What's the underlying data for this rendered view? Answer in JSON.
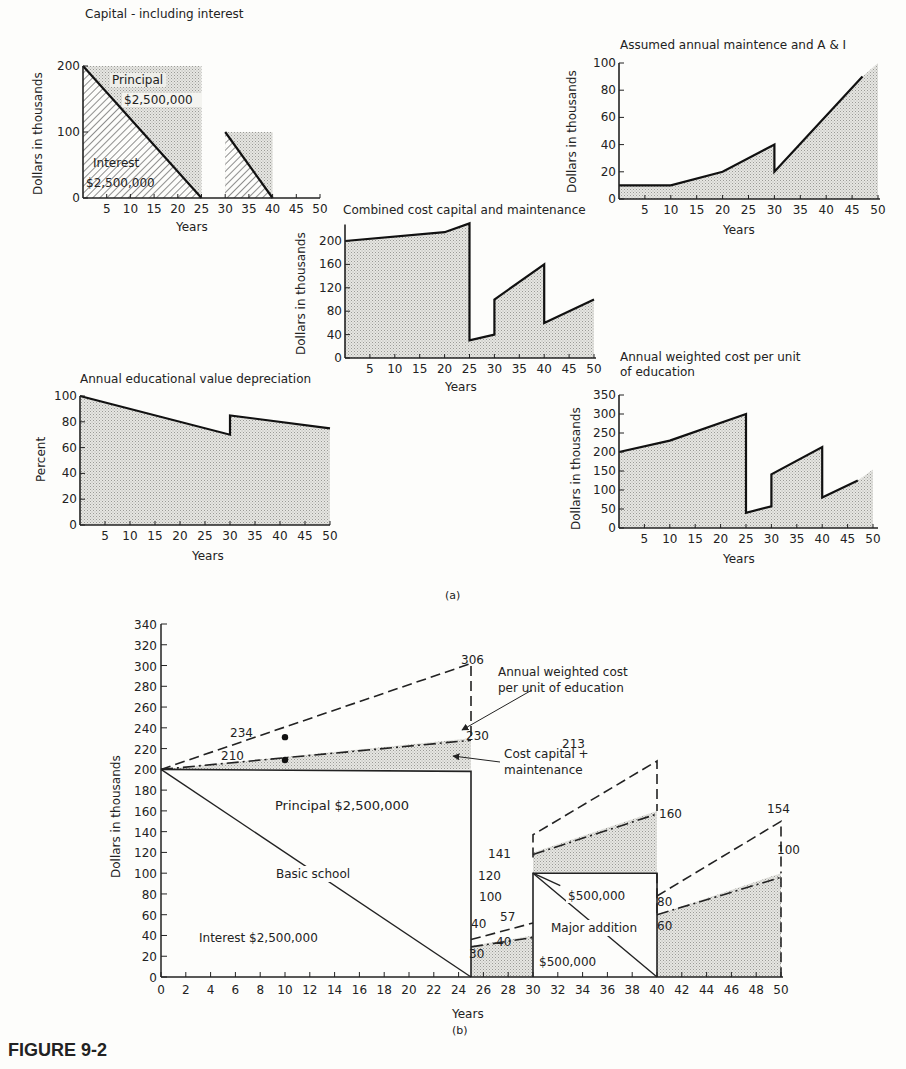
{
  "figure_label": "FIGURE 9-2",
  "panel_a_label": "(a)",
  "panel_b_label": "(b)",
  "chart_data": [
    {
      "id": "capital",
      "type": "area",
      "title": "Capital - including interest",
      "xlabel": "Years",
      "ylabel": "Dollars in thousands",
      "xticks": [
        5,
        10,
        15,
        20,
        25,
        30,
        35,
        40,
        45,
        50
      ],
      "yticks": [
        0,
        100,
        200
      ],
      "ylim": [
        0,
        200
      ],
      "series": [
        {
          "name": "Principal",
          "x": [
            0,
            25,
            25
          ],
          "y": [
            200,
            200,
            0
          ],
          "fill": "dotted"
        },
        {
          "name": "Interest",
          "x": [
            0,
            25
          ],
          "y": [
            200,
            0
          ],
          "fill": "hatched"
        },
        {
          "name": "Addition principal",
          "x": [
            30,
            40,
            40
          ],
          "y": [
            100,
            100,
            0
          ],
          "fill": "dotted"
        },
        {
          "name": "Addition interest",
          "x": [
            30,
            40
          ],
          "y": [
            100,
            0
          ],
          "fill": "hatched"
        }
      ],
      "annotations": [
        "Principal",
        "$2,500,000",
        "Interest",
        "$2,500,000"
      ]
    },
    {
      "id": "maintenance",
      "type": "area",
      "title": "Assumed annual maintence and A & I",
      "xlabel": "Years",
      "ylabel": "Dollars in thousands",
      "xticks": [
        5,
        10,
        15,
        20,
        25,
        30,
        35,
        40,
        45,
        50
      ],
      "yticks": [
        0,
        20,
        40,
        60,
        80,
        100
      ],
      "ylim": [
        0,
        100
      ],
      "x": [
        0,
        10,
        20,
        30,
        30,
        47,
        50
      ],
      "y": [
        10,
        10,
        20,
        40,
        20,
        90,
        100
      ]
    },
    {
      "id": "combined",
      "type": "area",
      "title": "Combined cost capital and maintenance",
      "xlabel": "Years",
      "ylabel": "Dollars in thousands",
      "xticks": [
        5,
        10,
        15,
        20,
        25,
        30,
        35,
        40,
        45,
        50
      ],
      "yticks": [
        0,
        40,
        80,
        120,
        160,
        200
      ],
      "ylim": [
        0,
        230
      ],
      "x": [
        0,
        20,
        25,
        25,
        30,
        30,
        40,
        40,
        50
      ],
      "y": [
        200,
        215,
        230,
        30,
        40,
        100,
        160,
        60,
        100
      ]
    },
    {
      "id": "educational",
      "type": "area",
      "title": "Annual educational value depreciation",
      "xlabel": "Years",
      "ylabel": "Percent",
      "xticks": [
        5,
        10,
        15,
        20,
        25,
        30,
        35,
        40,
        45,
        50
      ],
      "yticks": [
        0,
        20,
        40,
        60,
        80,
        100
      ],
      "ylim": [
        0,
        100
      ],
      "x": [
        0,
        30,
        30,
        50
      ],
      "y": [
        100,
        70,
        85,
        75
      ]
    },
    {
      "id": "weighted",
      "type": "area",
      "title": "Annual weighted cost per unit of education",
      "title_lines": [
        "Annual weighted cost per unit",
        "of education"
      ],
      "xlabel": "Years",
      "ylabel": "Dollars in thousands",
      "xticks": [
        5,
        10,
        15,
        20,
        25,
        30,
        35,
        40,
        45,
        50
      ],
      "yticks": [
        0,
        50,
        100,
        150,
        200,
        250,
        300,
        350
      ],
      "ylim": [
        0,
        350
      ],
      "x": [
        0,
        10,
        25,
        25,
        30,
        30,
        40,
        40,
        47,
        50
      ],
      "y": [
        200,
        230,
        300,
        40,
        57,
        141,
        213,
        80,
        125,
        154
      ]
    },
    {
      "id": "combined_b",
      "type": "line",
      "title": "",
      "xlabel": "Years",
      "ylabel": "Dollars in thousands",
      "xticks": [
        0,
        2,
        4,
        6,
        8,
        10,
        12,
        14,
        16,
        18,
        20,
        22,
        24,
        26,
        28,
        30,
        32,
        34,
        36,
        38,
        40,
        42,
        44,
        46,
        48,
        50
      ],
      "yticks": [
        0,
        20,
        40,
        60,
        80,
        100,
        120,
        140,
        160,
        180,
        200,
        220,
        240,
        260,
        280,
        300,
        320,
        340
      ],
      "ylim": [
        0,
        340
      ],
      "xlim": [
        0,
        50
      ],
      "series": [
        {
          "name": "Annual weighted cost per unit of education",
          "style": "dashed",
          "x": [
            0,
            10,
            25,
            25,
            30,
            30,
            40,
            40,
            50,
            50
          ],
          "y": [
            200,
            234,
            306,
            40,
            57,
            141,
            213,
            80,
            154,
            100
          ]
        },
        {
          "name": "Cost capital + maintenance",
          "style": "dash-dot",
          "x": [
            0,
            10,
            25,
            25,
            30,
            30,
            40,
            40,
            50
          ],
          "y": [
            200,
            210,
            230,
            30,
            40,
            120,
            160,
            60,
            100
          ]
        },
        {
          "name": "Basic school principal",
          "style": "solid",
          "x": [
            0,
            25,
            25
          ],
          "y": [
            200,
            200,
            0
          ]
        },
        {
          "name": "Basic school interest",
          "style": "solid",
          "x": [
            0,
            25
          ],
          "y": [
            200,
            0
          ]
        },
        {
          "name": "Major addition principal",
          "style": "solid",
          "x": [
            30,
            30,
            40,
            40
          ],
          "y": [
            0,
            100,
            100,
            0
          ]
        },
        {
          "name": "Major addition interest",
          "style": "solid",
          "x": [
            30,
            40
          ],
          "y": [
            100,
            0
          ]
        }
      ],
      "point_labels": [
        {
          "x": 10,
          "y": 234,
          "label": "234"
        },
        {
          "x": 10,
          "y": 210,
          "label": "210"
        },
        {
          "x": 25,
          "y": 306,
          "label": "306"
        },
        {
          "x": 25,
          "y": 230,
          "label": "230"
        },
        {
          "x": 25,
          "y": 40,
          "label": "40"
        },
        {
          "x": 25,
          "y": 30,
          "label": "30"
        },
        {
          "x": 30,
          "y": 57,
          "label": "57"
        },
        {
          "x": 30,
          "y": 40,
          "label": "40"
        },
        {
          "x": 30,
          "y": 141,
          "label": "141"
        },
        {
          "x": 30,
          "y": 120,
          "label": "120"
        },
        {
          "x": 30,
          "y": 100,
          "label": "100"
        },
        {
          "x": 40,
          "y": 213,
          "label": "213"
        },
        {
          "x": 40,
          "y": 160,
          "label": "160"
        },
        {
          "x": 40,
          "y": 80,
          "label": "80"
        },
        {
          "x": 40,
          "y": 60,
          "label": "60"
        },
        {
          "x": 50,
          "y": 154,
          "label": "154"
        },
        {
          "x": 50,
          "y": 100,
          "label": "100"
        }
      ],
      "annotations": [
        "Annual weighted cost per unit of education",
        "Cost capital + maintenance",
        "Principal $2,500,000",
        "Basic school",
        "Interest $2,500,000",
        "$500,000",
        "Major addition",
        "$500,000"
      ]
    }
  ],
  "labels": {
    "c1_title": "Capital - including interest",
    "c1_principal": "Principal",
    "c1_principal_amt": "$2,500,000",
    "c1_interest": "Interest",
    "c1_interest_amt": "$2,500,000",
    "c2_title": "Assumed annual maintence and A & I",
    "c3_title": "Combined cost capital and maintenance",
    "c4_title": "Annual educational value depreciation",
    "c5_title_1": "Annual weighted cost per unit",
    "c5_title_2": "of education",
    "y_dollars": "Dollars in thousands",
    "y_percent": "Percent",
    "x_years": "Years",
    "b_ann1": "Annual weighted cost",
    "b_ann2": "per unit of education",
    "b_cost1": "Cost capital +",
    "b_cost2": "maintenance",
    "b_principal": "Principal $2,500,000",
    "b_basic": "Basic school",
    "b_interest": "Interest $2,500,000",
    "b_add_top": "$500,000",
    "b_major": "Major addition",
    "b_add_bot": "$500,000"
  }
}
